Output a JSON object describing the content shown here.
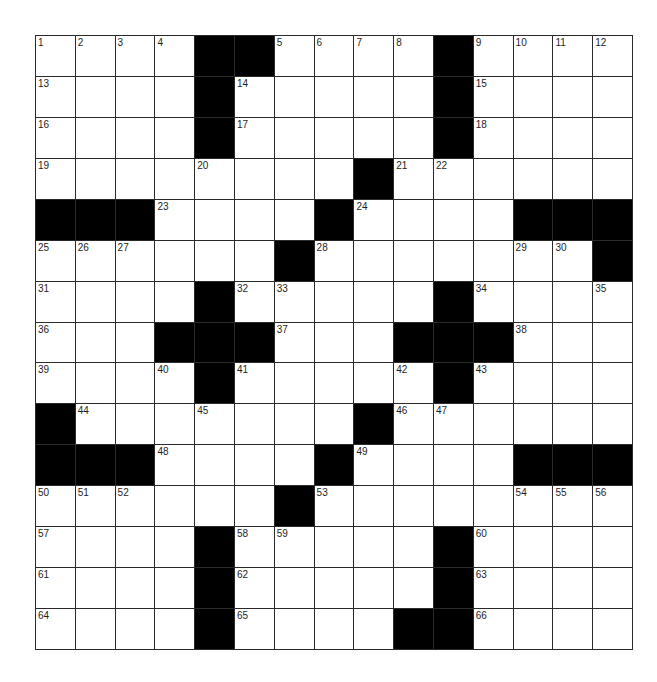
{
  "puzzle": {
    "rows": 15,
    "cols": 15,
    "colors": {
      "block": "#000000",
      "cell": "#ffffff",
      "grid_line": "#2a2a2a",
      "number_text": "#1e1e1e"
    },
    "grid": [
      "....##....#....",
      "....#.....#....",
      "....#.....#....",
      "........#......",
      "###....#....###",
      "......#.......#",
      "....#.....#....",
      "...###...###...",
      "....#.....#....",
      "#.......#......",
      "###....#....###",
      "......#........",
      "....#.....#....",
      "....#.....#....",
      "....#....##...."
    ],
    "numbers": [
      {
        "r": 0,
        "c": 0,
        "n": "1"
      },
      {
        "r": 0,
        "c": 1,
        "n": "2"
      },
      {
        "r": 0,
        "c": 2,
        "n": "3"
      },
      {
        "r": 0,
        "c": 3,
        "n": "4"
      },
      {
        "r": 0,
        "c": 6,
        "n": "5"
      },
      {
        "r": 0,
        "c": 7,
        "n": "6"
      },
      {
        "r": 0,
        "c": 8,
        "n": "7"
      },
      {
        "r": 0,
        "c": 9,
        "n": "8"
      },
      {
        "r": 0,
        "c": 11,
        "n": "9"
      },
      {
        "r": 0,
        "c": 12,
        "n": "10"
      },
      {
        "r": 0,
        "c": 13,
        "n": "11"
      },
      {
        "r": 0,
        "c": 14,
        "n": "12"
      },
      {
        "r": 1,
        "c": 0,
        "n": "13"
      },
      {
        "r": 1,
        "c": 5,
        "n": "14"
      },
      {
        "r": 1,
        "c": 11,
        "n": "15"
      },
      {
        "r": 2,
        "c": 0,
        "n": "16"
      },
      {
        "r": 2,
        "c": 5,
        "n": "17"
      },
      {
        "r": 2,
        "c": 11,
        "n": "18"
      },
      {
        "r": 3,
        "c": 0,
        "n": "19"
      },
      {
        "r": 3,
        "c": 4,
        "n": "20"
      },
      {
        "r": 3,
        "c": 9,
        "n": "21"
      },
      {
        "r": 3,
        "c": 10,
        "n": "22"
      },
      {
        "r": 4,
        "c": 3,
        "n": "23"
      },
      {
        "r": 4,
        "c": 8,
        "n": "24"
      },
      {
        "r": 5,
        "c": 0,
        "n": "25"
      },
      {
        "r": 5,
        "c": 1,
        "n": "26"
      },
      {
        "r": 5,
        "c": 2,
        "n": "27"
      },
      {
        "r": 5,
        "c": 7,
        "n": "28"
      },
      {
        "r": 5,
        "c": 12,
        "n": "29"
      },
      {
        "r": 5,
        "c": 13,
        "n": "30"
      },
      {
        "r": 6,
        "c": 0,
        "n": "31"
      },
      {
        "r": 6,
        "c": 5,
        "n": "32"
      },
      {
        "r": 6,
        "c": 6,
        "n": "33"
      },
      {
        "r": 6,
        "c": 11,
        "n": "34"
      },
      {
        "r": 6,
        "c": 14,
        "n": "35"
      },
      {
        "r": 7,
        "c": 0,
        "n": "36"
      },
      {
        "r": 7,
        "c": 6,
        "n": "37"
      },
      {
        "r": 7,
        "c": 12,
        "n": "38"
      },
      {
        "r": 8,
        "c": 0,
        "n": "39"
      },
      {
        "r": 8,
        "c": 3,
        "n": "40"
      },
      {
        "r": 8,
        "c": 5,
        "n": "41"
      },
      {
        "r": 8,
        "c": 9,
        "n": "42"
      },
      {
        "r": 8,
        "c": 11,
        "n": "43"
      },
      {
        "r": 9,
        "c": 1,
        "n": "44"
      },
      {
        "r": 9,
        "c": 4,
        "n": "45"
      },
      {
        "r": 9,
        "c": 9,
        "n": "46"
      },
      {
        "r": 9,
        "c": 10,
        "n": "47"
      },
      {
        "r": 10,
        "c": 3,
        "n": "48"
      },
      {
        "r": 10,
        "c": 8,
        "n": "49"
      },
      {
        "r": 11,
        "c": 0,
        "n": "50"
      },
      {
        "r": 11,
        "c": 1,
        "n": "51"
      },
      {
        "r": 11,
        "c": 2,
        "n": "52"
      },
      {
        "r": 11,
        "c": 7,
        "n": "53"
      },
      {
        "r": 11,
        "c": 12,
        "n": "54"
      },
      {
        "r": 11,
        "c": 13,
        "n": "55"
      },
      {
        "r": 11,
        "c": 14,
        "n": "56"
      },
      {
        "r": 12,
        "c": 0,
        "n": "57"
      },
      {
        "r": 12,
        "c": 5,
        "n": "58"
      },
      {
        "r": 12,
        "c": 6,
        "n": "59"
      },
      {
        "r": 12,
        "c": 11,
        "n": "60"
      },
      {
        "r": 13,
        "c": 0,
        "n": "61"
      },
      {
        "r": 13,
        "c": 5,
        "n": "62"
      },
      {
        "r": 13,
        "c": 11,
        "n": "63"
      },
      {
        "r": 14,
        "c": 0,
        "n": "64"
      },
      {
        "r": 14,
        "c": 5,
        "n": "65"
      },
      {
        "r": 14,
        "c": 11,
        "n": "66"
      }
    ]
  }
}
